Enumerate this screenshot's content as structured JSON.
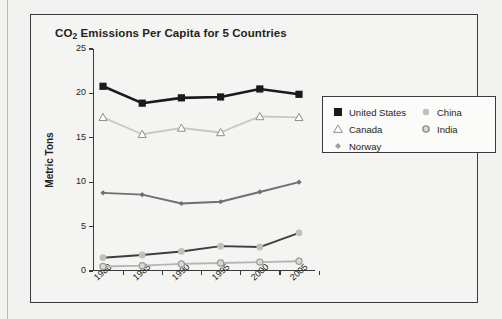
{
  "figure": {
    "title_prefix": "CO",
    "title_sub": "2",
    "title_rest": " Emissions Per Capita for 5 Countries"
  },
  "chart_data": {
    "type": "line",
    "title": "CO2 Emissions Per Capita for 5 Countries",
    "xlabel": "",
    "ylabel": "Metric Tons",
    "categories": [
      "1980",
      "1985",
      "1990",
      "1995",
      "2000",
      "2005"
    ],
    "x": [
      1980,
      1985,
      1990,
      1995,
      2000,
      2005
    ],
    "ylim": [
      0,
      25
    ],
    "yticks": [
      0,
      5,
      10,
      15,
      20,
      25
    ],
    "grid": false,
    "legend_position": "upper-right-outside",
    "series": [
      {
        "name": "United States",
        "values": [
          20.8,
          18.9,
          19.5,
          19.6,
          20.5,
          19.9
        ],
        "color": "#1a1a1a",
        "marker": "filled-square"
      },
      {
        "name": "Canada",
        "values": [
          17.3,
          15.4,
          16.1,
          15.6,
          17.4,
          17.3
        ],
        "color": "#c9c9c7",
        "marker": "open-triangle"
      },
      {
        "name": "Norway",
        "values": [
          8.8,
          8.6,
          7.6,
          7.8,
          8.9,
          10.0
        ],
        "color": "#6f6f6f",
        "marker": "small-diamond"
      },
      {
        "name": "China",
        "values": [
          1.5,
          1.8,
          2.2,
          2.8,
          2.7,
          4.3
        ],
        "color": "#3d3d3d",
        "marker": "light-circle"
      },
      {
        "name": "India",
        "values": [
          0.5,
          0.6,
          0.8,
          0.9,
          1.0,
          1.1
        ],
        "color": "#b5b5b3",
        "marker": "ringed-circle"
      }
    ]
  },
  "legend": {
    "left_column": [
      {
        "label": "United States",
        "marker": "filled-square-icon"
      },
      {
        "label": "Canada",
        "marker": "open-triangle-icon"
      },
      {
        "label": "Norway",
        "marker": "small-diamond-icon"
      }
    ],
    "right_column": [
      {
        "label": "China",
        "marker": "light-circle-icon"
      },
      {
        "label": "India",
        "marker": "ringed-circle-icon"
      }
    ]
  }
}
